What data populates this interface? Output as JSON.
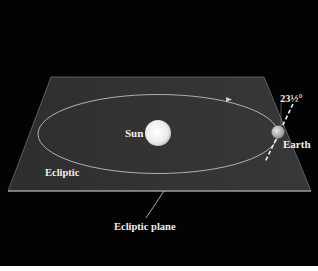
{
  "diagram": {
    "labels": {
      "sun": "Sun",
      "earth": "Earth",
      "ecliptic": "Ecliptic",
      "ecliptic_plane": "Ecliptic plane",
      "tilt": "23½°"
    },
    "colors": {
      "background": "#030303",
      "plane_fill": "#2a2a2a",
      "plane_edge": "#9a9a9a",
      "orbit": "#b0b0b0",
      "sun": "#f4f4f4",
      "earth": "#cfcfcf",
      "text": "#eeeeee"
    }
  }
}
